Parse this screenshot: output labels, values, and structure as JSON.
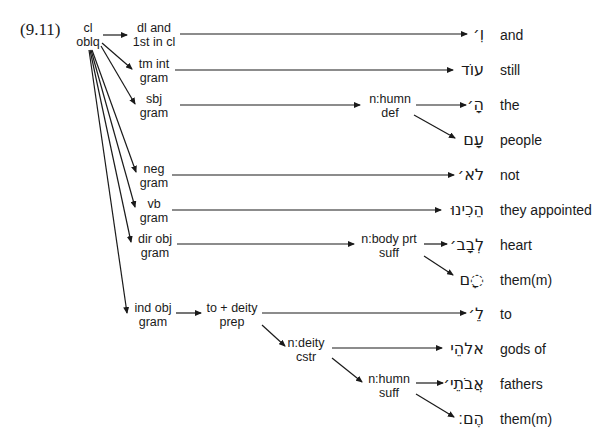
{
  "example_number": "(9.11)",
  "root": {
    "line1": "cl",
    "line2": "oblq"
  },
  "nodes": [
    {
      "id": "dl",
      "line1": "dl and",
      "line2": "1st in cl",
      "x": 120,
      "y": 8
    },
    {
      "id": "tm",
      "line1": "tm int",
      "line2": "gram",
      "x": 121,
      "y": 43
    },
    {
      "id": "sbj",
      "line1": "sbj",
      "line2": "gram",
      "x": 121,
      "y": 78
    },
    {
      "id": "nhumn_def",
      "line1": "n:humn",
      "line2": "def",
      "x": 397,
      "y": 92
    },
    {
      "id": "neg",
      "line1": "neg",
      "line2": "gram",
      "x": 121,
      "y": 150
    },
    {
      "id": "vb",
      "line1": "vb",
      "line2": "gram",
      "x": 121,
      "y": 185
    },
    {
      "id": "dirobj",
      "line1": "dir obj",
      "line2": "gram",
      "x": 122,
      "y": 220
    },
    {
      "id": "nbody",
      "line1": "n:body prt",
      "line2": "suff",
      "x": 396,
      "y": 228
    },
    {
      "id": "indobj",
      "line1": "ind obj",
      "line2": "gram",
      "x": 150,
      "y": 292
    },
    {
      "id": "todeity",
      "line1": "to + deity",
      "line2": "prep",
      "x": 232,
      "y": 292
    },
    {
      "id": "ndeity",
      "line1": "n:deity",
      "line2": "cstr",
      "x": 306,
      "y": 327
    },
    {
      "id": "nhumn_suff",
      "line1": "n:humn",
      "line2": "suff",
      "x": 388,
      "y": 362
    }
  ],
  "words": [
    {
      "hebrew": "וְ׳",
      "gloss": "and",
      "y": 22
    },
    {
      "hebrew": "עוֹד",
      "gloss": "still",
      "y": 58
    },
    {
      "hebrew": "הָ׳",
      "gloss": "the",
      "y": 93
    },
    {
      "hebrew": "עָם",
      "gloss": "people",
      "y": 128
    },
    {
      "hebrew": "לֹא׳",
      "gloss": "not",
      "y": 163
    },
    {
      "hebrew": "הֵכִינוּ",
      "gloss": "they appointed",
      "y": 198
    },
    {
      "hebrew": "לְבָב׳",
      "gloss": "heart",
      "y": 233
    },
    {
      "hebrew": "◌ָם",
      "gloss": "them(m)",
      "y": 268
    },
    {
      "hebrew": "לֵ׳",
      "gloss": "to",
      "y": 303
    },
    {
      "hebrew": "אלהֵי",
      "gloss": "gods of",
      "y": 339
    },
    {
      "hebrew": "אֲבֹתֵי׳",
      "gloss": "fathers",
      "y": 374
    },
    {
      "hebrew": "הֶם׃",
      "gloss": "them(m)",
      "y": 410
    }
  ]
}
